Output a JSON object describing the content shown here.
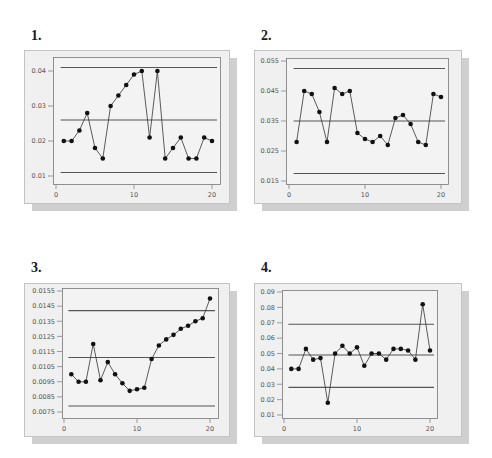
{
  "panels": [
    {
      "label": "1."
    },
    {
      "label": "2."
    },
    {
      "label": "3."
    },
    {
      "label": "4."
    }
  ],
  "chart_data": [
    {
      "type": "line",
      "title": "1.",
      "xlabel": "",
      "ylabel": "",
      "x": [
        1,
        2,
        3,
        4,
        5,
        6,
        7,
        8,
        9,
        10,
        11,
        12,
        13,
        14,
        15,
        16,
        17,
        18,
        19,
        20
      ],
      "series": [
        {
          "name": "values",
          "values": [
            0.02,
            0.02,
            0.023,
            0.028,
            0.018,
            0.015,
            0.03,
            0.033,
            0.036,
            0.039,
            0.04,
            0.021,
            0.04,
            0.015,
            0.018,
            0.021,
            0.015,
            0.015,
            0.021,
            0.02
          ]
        },
        {
          "name": "UCL",
          "values": [
            0.041
          ]
        },
        {
          "name": "CL",
          "values": [
            0.026
          ]
        },
        {
          "name": "LCL",
          "values": [
            0.011
          ]
        }
      ],
      "xticks": [
        0,
        10,
        20
      ],
      "yticks": [
        0.01,
        0.02,
        0.03,
        0.04
      ],
      "ytick_labels": [
        "0.01",
        "0.02",
        "0.03",
        "0.04"
      ],
      "xlim": [
        0,
        21
      ],
      "ylim": [
        0.008,
        0.0425
      ],
      "grid": false
    },
    {
      "type": "line",
      "title": "2.",
      "xlabel": "",
      "ylabel": "",
      "x": [
        1,
        2,
        3,
        4,
        5,
        6,
        7,
        8,
        9,
        10,
        11,
        12,
        13,
        14,
        15,
        16,
        17,
        18,
        19,
        20
      ],
      "series": [
        {
          "name": "values",
          "values": [
            0.028,
            0.045,
            0.044,
            0.038,
            0.028,
            0.046,
            0.044,
            0.045,
            0.031,
            0.029,
            0.028,
            0.03,
            0.027,
            0.036,
            0.037,
            0.034,
            0.028,
            0.027,
            0.044,
            0.043
          ]
        },
        {
          "name": "UCL",
          "values": [
            0.0525
          ]
        },
        {
          "name": "CL",
          "values": [
            0.035
          ]
        },
        {
          "name": "LCL",
          "values": [
            0.0175
          ]
        }
      ],
      "xticks": [
        0,
        10,
        20
      ],
      "yticks": [
        0.015,
        0.025,
        0.035,
        0.045,
        0.055
      ],
      "ytick_labels": [
        "0.015",
        "0.025",
        "0.035",
        "0.045",
        "0.055"
      ],
      "xlim": [
        0,
        21
      ],
      "ylim": [
        0.015,
        0.056
      ],
      "grid": false
    },
    {
      "type": "line",
      "title": "3.",
      "xlabel": "",
      "ylabel": "",
      "x": [
        1,
        2,
        3,
        4,
        5,
        6,
        7,
        8,
        9,
        10,
        11,
        12,
        13,
        14,
        15,
        16,
        17,
        18,
        19,
        20
      ],
      "series": [
        {
          "name": "values",
          "values": [
            0.01,
            0.0095,
            0.0095,
            0.012,
            0.0096,
            0.0108,
            0.01,
            0.0094,
            0.0089,
            0.009,
            0.0091,
            0.011,
            0.0119,
            0.0123,
            0.0126,
            0.013,
            0.0132,
            0.0135,
            0.0137,
            0.015
          ]
        },
        {
          "name": "UCL",
          "values": [
            0.0142
          ]
        },
        {
          "name": "CL",
          "values": [
            0.0111
          ]
        },
        {
          "name": "LCL",
          "values": [
            0.0079
          ]
        }
      ],
      "xticks": [
        0,
        10,
        20
      ],
      "yticks": [
        0.0075,
        0.0085,
        0.0095,
        0.0105,
        0.0115,
        0.0125,
        0.0135,
        0.0145,
        0.0155
      ],
      "ytick_labels": [
        "0.0075",
        "0.0085",
        "0.0095",
        "0.0105",
        "0.0115",
        "0.0125",
        "0.0135",
        "0.0145",
        "0.0155"
      ],
      "xlim": [
        0,
        21
      ],
      "ylim": [
        0.0073,
        0.0156
      ],
      "grid": false
    },
    {
      "type": "line",
      "title": "4.",
      "xlabel": "",
      "ylabel": "",
      "x": [
        1,
        2,
        3,
        4,
        5,
        6,
        7,
        8,
        9,
        10,
        11,
        12,
        13,
        14,
        15,
        16,
        17,
        18,
        19,
        20
      ],
      "series": [
        {
          "name": "values",
          "values": [
            0.04,
            0.04,
            0.053,
            0.046,
            0.047,
            0.018,
            0.05,
            0.055,
            0.05,
            0.054,
            0.042,
            0.05,
            0.05,
            0.046,
            0.053,
            0.053,
            0.052,
            0.046,
            0.082,
            0.052
          ]
        },
        {
          "name": "UCL",
          "values": [
            0.069
          ]
        },
        {
          "name": "CL",
          "values": [
            0.049
          ]
        },
        {
          "name": "LCL",
          "values": [
            0.028
          ]
        }
      ],
      "xticks": [
        0,
        10,
        20
      ],
      "yticks": [
        0.01,
        0.02,
        0.03,
        0.04,
        0.05,
        0.06,
        0.07,
        0.08,
        0.09
      ],
      "ytick_labels": [
        "0.01",
        "0.02",
        "0.03",
        "0.04",
        "0.05",
        "0.06",
        "0.07",
        "0.08",
        "0.09"
      ],
      "xlim": [
        0,
        21
      ],
      "ylim": [
        0.008,
        0.091
      ],
      "grid": false
    }
  ],
  "style": {
    "frame_bg": "#f0f0f0",
    "plot_bg": "#f3f3f3",
    "shadow": "#cfcfcf",
    "line_color": "#333333",
    "limit_line_color": "#555555",
    "marker_color": "#111111"
  }
}
